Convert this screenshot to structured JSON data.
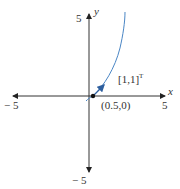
{
  "diagram": {
    "axes": {
      "x_label": "x",
      "y_label": "y",
      "x_min_label": "− 5",
      "x_max_label": "5",
      "y_max_label": "5",
      "y_min_label": "− 5"
    },
    "point": {
      "label": "(0.5,0)"
    },
    "vector": {
      "label": "[1,1]",
      "superscript": "T"
    },
    "colors": {
      "axes": "#333333",
      "curve": "#4a86c5",
      "point": "#111111"
    }
  }
}
